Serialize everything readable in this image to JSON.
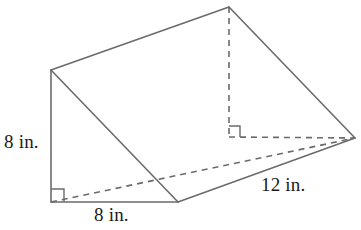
{
  "figure": {
    "name": "triangular-prism",
    "stroke_color": "#6b6b6b",
    "fill_color": "#ffffff",
    "label_color": "#1a1a1a",
    "stroke_width": 1.6,
    "dash_pattern": "6,5",
    "canvas": {
      "width": 361,
      "height": 230
    }
  },
  "labels": {
    "height": "8 in.",
    "base": "8 in.",
    "length": "12 in."
  },
  "vertices": {
    "top_left": {
      "x": 51,
      "y": 70
    },
    "apex": {
      "x": 229,
      "y": 7
    },
    "right": {
      "x": 355,
      "y": 138
    },
    "bottom_left": {
      "x": 51,
      "y": 202
    },
    "bottom_front": {
      "x": 178,
      "y": 202
    },
    "hidden_foot": {
      "x": 229,
      "y": 137
    }
  },
  "edges": {
    "solid": [
      "top_left-apex",
      "apex-right",
      "top_left-bottom_left",
      "top_left-bottom_front",
      "bottom_left-bottom_front",
      "bottom_front-right"
    ],
    "dashed": [
      "apex-hidden_foot",
      "hidden_foot-right",
      "bottom_left-right"
    ]
  },
  "right_angle_markers": [
    {
      "name": "bottom-left-right-angle",
      "x": 51,
      "y": 202,
      "size": 13,
      "style": "solid"
    },
    {
      "name": "hidden-foot-right-angle",
      "x": 229,
      "y": 137,
      "size": 11,
      "style": "solid"
    }
  ]
}
